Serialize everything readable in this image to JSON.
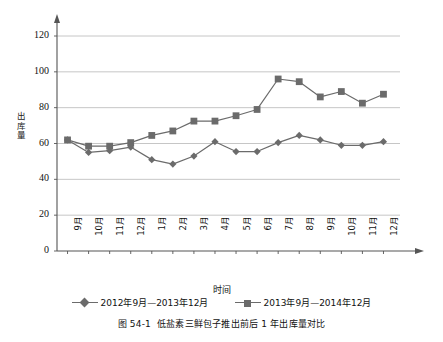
{
  "chart_data": {
    "type": "line",
    "title": "",
    "xlabel": "时间",
    "ylabel": "出库量",
    "categories": [
      "9月",
      "10月",
      "11月",
      "12月",
      "1月",
      "2月",
      "3月",
      "4月",
      "5月",
      "6月",
      "7月",
      "8月",
      "9月",
      "10月",
      "11月",
      "12月"
    ],
    "series": [
      {
        "name": "2012年9月—2013年12月",
        "marker": "diamond",
        "color": "#6b6b6b",
        "values": [
          62,
          55,
          56,
          58,
          51,
          48.5,
          53,
          61,
          55.5,
          55.5,
          60.5,
          64.5,
          62,
          59,
          59,
          61
        ]
      },
      {
        "name": "2013年9月—2014年12月",
        "marker": "square",
        "color": "#6b6b6b",
        "values": [
          62,
          58.5,
          58.5,
          60.5,
          64.5,
          67,
          72.5,
          72.5,
          75.5,
          79,
          96,
          94.5,
          86,
          89,
          82.5,
          87.5
        ]
      }
    ],
    "ylim": [
      0,
      120
    ],
    "yticks": [
      0,
      20,
      40,
      60,
      80,
      100,
      120
    ],
    "grid": "horizontal",
    "legend_position": "bottom",
    "axis_arrows": true
  },
  "axes": {
    "y_title_chars": [
      "出",
      "库",
      "量"
    ],
    "x_title": "时间"
  },
  "legend": {
    "items": [
      {
        "label": "2012年9月—2013年12月",
        "marker": "diamond-marker"
      },
      {
        "label": "2013年9月—2014年12月",
        "marker": "square-marker"
      }
    ]
  },
  "caption": {
    "number": "图 54-1",
    "text": "低盐素三鲜包子推出前后 1 年出库量对比"
  },
  "colors": {
    "series": "#6b6b6b",
    "grid": "#b8b8b8",
    "axis": "#555555",
    "text": "#111111"
  }
}
